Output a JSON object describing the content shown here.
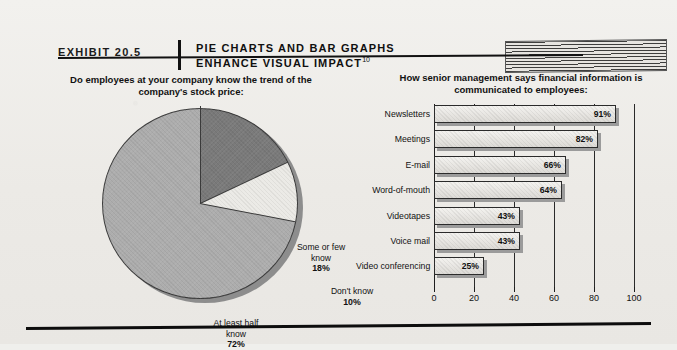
{
  "header": {
    "exhibit_label": "EXHIBIT 20.5",
    "title_line1": "PIE CHARTS AND BAR GRAPHS",
    "title_line2": "ENHANCE VISUAL IMPACT",
    "title_superscript": "10"
  },
  "pie": {
    "title": "Do employees at your company know the trend of the company's stock price:",
    "labels": {
      "some": "Some or few know",
      "some_value": "18%",
      "dont": "Don't know",
      "dont_value": "10%",
      "half": "At least half know",
      "half_value": "72%"
    }
  },
  "bar": {
    "title": "How senior management says financial information is communicated to employees:"
  },
  "chart_data": [
    {
      "type": "pie",
      "title": "Do employees at your company know the trend of the company's stock price:",
      "labels": [
        "Some or few know",
        "Don't know",
        "At least half know"
      ],
      "values": [
        18,
        10,
        72
      ],
      "value_labels": [
        "18%",
        "10%",
        "72%"
      ],
      "colors": [
        "#7a7a7a",
        "#ebeae6",
        "#adadad"
      ],
      "start_angle_deg": 0,
      "direction": "clockwise",
      "legend": "inside-slices"
    },
    {
      "type": "bar",
      "orientation": "horizontal",
      "title": "How senior management says financial information is communicated to employees:",
      "categories": [
        "Newsletters",
        "Meetings",
        "E-mail",
        "Word-of-mouth",
        "Videotapes",
        "Voice mail",
        "Video conferencing"
      ],
      "values": [
        91,
        82,
        66,
        64,
        43,
        43,
        25
      ],
      "value_labels": [
        "91%",
        "82%",
        "66%",
        "64%",
        "43%",
        "43%",
        "25%"
      ],
      "xlabel": "",
      "ylabel": "",
      "xlim": [
        0,
        100
      ],
      "xticks": [
        0,
        20,
        40,
        60,
        80,
        100
      ],
      "xtick_labels": [
        "0",
        "20",
        "40",
        "60",
        "80",
        "100"
      ],
      "grid": true,
      "legend": "none"
    }
  ]
}
